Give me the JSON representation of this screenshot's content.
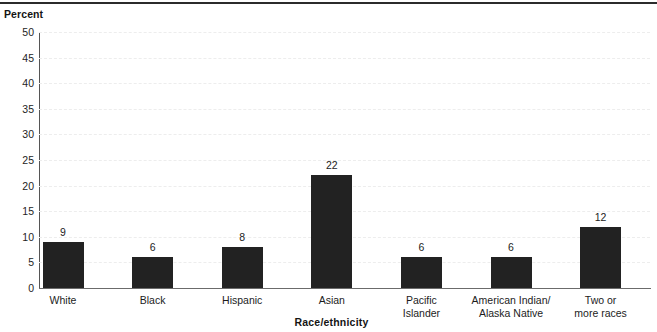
{
  "chart_data": {
    "type": "bar",
    "title": "",
    "subtitle": "",
    "xlabel": "Race/ethnicity",
    "ylabel": "Percent",
    "ylim": [
      0,
      50
    ],
    "ytick_step": 5,
    "yticks": [
      "50",
      "45",
      "40",
      "35",
      "30",
      "25",
      "20",
      "15",
      "10",
      "5",
      "0"
    ],
    "grid": true,
    "legend": "none",
    "bar_color": "#222222",
    "categories": [
      "White",
      "Black",
      "Hispanic",
      "Asian",
      "Pacific Islander",
      "American Indian/ Alaska Native",
      "Two or more races"
    ],
    "category_lines": [
      [
        "White"
      ],
      [
        "Black"
      ],
      [
        "Hispanic"
      ],
      [
        "Asian"
      ],
      [
        "Pacific",
        "Islander"
      ],
      [
        "American Indian/",
        "Alaska Native"
      ],
      [
        "Two or",
        "more races"
      ]
    ],
    "values": [
      9,
      6,
      8,
      22,
      6,
      6,
      12
    ],
    "value_labels": [
      "9",
      "6",
      "8",
      "22",
      "6",
      "6",
      "12"
    ]
  }
}
